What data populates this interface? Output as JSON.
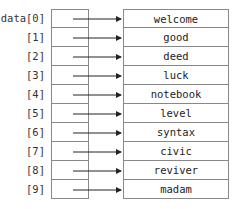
{
  "array_name": "data",
  "labels": [
    "data[0]",
    "[1]",
    "[2]",
    "[3]",
    "[4]",
    "[5]",
    "[6]",
    "[7]",
    "[8]",
    "[9]"
  ],
  "values": [
    "welcome",
    "good",
    "deed",
    "luck",
    "notebook",
    "level",
    "syntax",
    "civic",
    "reviver",
    "madam"
  ],
  "colors": {
    "border": "#888888",
    "arrow": "#222222",
    "text": "#222222"
  }
}
